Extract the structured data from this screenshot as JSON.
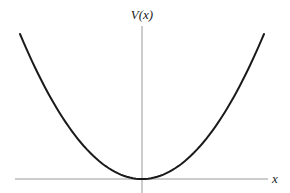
{
  "chart_data": {
    "type": "line",
    "title": "",
    "xlabel": "x",
    "ylabel": "V(x)",
    "grid": false,
    "legend": null,
    "series": [
      {
        "name": "V(x)",
        "description": "parabolic potential well, V(x) ∝ x², minimum at origin",
        "x": [
          -1.0,
          -0.75,
          -0.5,
          -0.25,
          0.0,
          0.25,
          0.5,
          0.75,
          1.0
        ],
        "values": [
          1.0,
          0.5625,
          0.25,
          0.0625,
          0.0,
          0.0625,
          0.25,
          0.5625,
          1.0
        ]
      }
    ],
    "xlim": [
      -1.1,
      1.1
    ],
    "ylim": [
      0,
      1.05
    ],
    "tick_labels": []
  },
  "colors": {
    "curve": "#1a1a1a",
    "axes": "#9a9a9a",
    "background": "#ffffff"
  }
}
